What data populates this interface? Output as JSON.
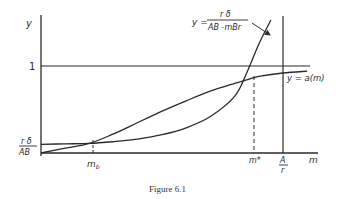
{
  "chart_data": {
    "type": "line",
    "title": "",
    "caption": "Figure 6.1",
    "xlabel": "m",
    "ylabel": "y",
    "y_tick_labels": [
      {
        "label": "1",
        "value": 1.0
      },
      {
        "label_num": "rδ",
        "label_den": "AB",
        "value": 0.1
      }
    ],
    "x_tick_labels": [
      {
        "label": "m",
        "sub": "b",
        "value": 0.2
      },
      {
        "label": "m*",
        "value": 0.85
      },
      {
        "label_num": "A",
        "label_den": "r",
        "value": 1.0
      }
    ],
    "xlim": [
      0,
      1.16
    ],
    "ylim": [
      0,
      1.2
    ],
    "series": [
      {
        "name": "hyperbola",
        "label": "y = rδ / (AB − mBr)",
        "label_num": "y = r δ",
        "label_den": "AB - mBr",
        "x": [
          0,
          0.1,
          0.2,
          0.3,
          0.4,
          0.5,
          0.6,
          0.7,
          0.8,
          0.85,
          0.9,
          0.95
        ],
        "y": [
          0.1,
          0.105,
          0.11,
          0.13,
          0.16,
          0.21,
          0.29,
          0.42,
          0.65,
          0.92,
          1.25,
          1.55
        ]
      },
      {
        "name": "a(m)",
        "label": "y = a(m)",
        "x": [
          0,
          0.1,
          0.2,
          0.3,
          0.4,
          0.5,
          0.6,
          0.7,
          0.8,
          0.85,
          0.9,
          1.0,
          1.1
        ],
        "y": [
          0,
          0.055,
          0.11,
          0.22,
          0.35,
          0.48,
          0.6,
          0.71,
          0.8,
          0.84,
          0.88,
          0.92,
          0.94
        ]
      }
    ],
    "reference_lines": [
      {
        "type": "horizontal",
        "value": 1.0,
        "style": "solid"
      },
      {
        "type": "vertical",
        "value": 1.0,
        "label": "A/r",
        "style": "solid"
      },
      {
        "type": "vertical",
        "value": 0.2,
        "label": "m_b",
        "style": "dashed"
      },
      {
        "type": "vertical",
        "value": 0.85,
        "label": "m*",
        "style": "dashed"
      }
    ],
    "annotations": [
      {
        "text": "y = rδ/(AB − mBr)",
        "arrow_to": "hyperbola"
      },
      {
        "text": "y = a(m)",
        "near": "a(m) curve right end"
      }
    ],
    "grid": false,
    "legend": "none"
  },
  "labels": {
    "y_axis": "y",
    "x_axis": "m",
    "one": "1",
    "rdelta_num": "r δ",
    "rdelta_den": "AB",
    "mb_main": "m",
    "mb_sub": "b",
    "mstar": "m*",
    "ar_num": "A",
    "ar_den": "r",
    "hyp_lhs": "y =",
    "hyp_num": "r δ",
    "hyp_den": "AB -mBr",
    "am_label": "y = a(m)",
    "caption": "Figure 6.1"
  }
}
